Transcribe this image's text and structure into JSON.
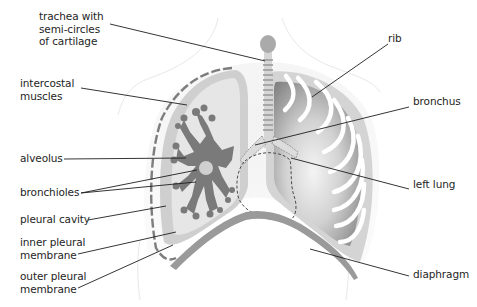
{
  "diagram": {
    "colors": {
      "background": "#ffffff",
      "body_outline": "#e6e6e6",
      "pleural_layer": "#cfcfcf",
      "right_lung_fill": "#e7e7e7",
      "bronchiole_tree": "#7a7a7a",
      "left_lung_dark": "#8f8f8f",
      "left_lung_light": "#f0f0f0",
      "rib": "#ffffff",
      "diaphragm": "#9a9a9a",
      "trachea": "#a9a9a9",
      "leader_line": "#1e1e1e",
      "text": "#1e1e1e"
    },
    "labels": [
      {
        "id": "trachea",
        "text": "trachea with\nsemi-circles\nof cartilage",
        "side": "left"
      },
      {
        "id": "intercostal",
        "text": "intercostal\nmuscles",
        "side": "left"
      },
      {
        "id": "alveolus",
        "text": "alveolus",
        "side": "left"
      },
      {
        "id": "bronchioles",
        "text": "bronchioles",
        "side": "left"
      },
      {
        "id": "pleural-cavity",
        "text": "pleural cavity",
        "side": "left"
      },
      {
        "id": "inner-pleural",
        "text": "inner pleural\nmembrane",
        "side": "left"
      },
      {
        "id": "outer-pleural",
        "text": "outer pleural\nmembrane",
        "side": "left"
      },
      {
        "id": "rib",
        "text": "rib",
        "side": "right"
      },
      {
        "id": "bronchus",
        "text": "bronchus",
        "side": "right"
      },
      {
        "id": "left-lung",
        "text": "left lung",
        "side": "right"
      },
      {
        "id": "diaphragm",
        "text": "diaphragm",
        "side": "right"
      }
    ]
  }
}
